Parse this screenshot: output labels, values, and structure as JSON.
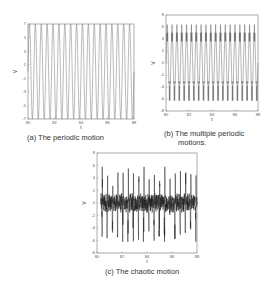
{
  "chart_data": [
    {
      "id": "a",
      "type": "line",
      "title": "(a)   The periodic motion",
      "xlabel": "t",
      "ylabel": "V",
      "xlim": [
        80,
        88
      ],
      "ylim": [
        -7,
        7
      ],
      "xticks": [
        "80",
        "82",
        "84",
        "86",
        "88"
      ],
      "yticks": [
        "7",
        "5",
        "3",
        "1",
        "-1",
        "-3",
        "-5",
        "-7"
      ],
      "series": [
        {
          "name": "V(t)",
          "form": "periodic",
          "cycles": 18,
          "amplitude": 7
        }
      ]
    },
    {
      "id": "b",
      "type": "line",
      "title": "(b) The multiple periodic motions.",
      "xlabel": "t",
      "ylabel": "V",
      "xlim": [
        80,
        88
      ],
      "ylim": [
        -8,
        8
      ],
      "xticks": [
        "80",
        "82",
        "84",
        "86",
        "88"
      ],
      "yticks": [
        "8",
        "6",
        "4",
        "2",
        "0",
        "-2",
        "-4",
        "-6",
        "-8"
      ],
      "series": [
        {
          "name": "V(t)",
          "form": "multi-periodic",
          "cycles": 19,
          "amplitude": 6.4,
          "band_inner": 2.6
        }
      ]
    },
    {
      "id": "c",
      "type": "line",
      "title": "(c) The chaotic motion",
      "xlabel": "t",
      "ylabel": "V",
      "xlim": [
        80,
        88
      ],
      "ylim": [
        -8,
        8
      ],
      "xticks": [
        "80",
        "82",
        "84",
        "86",
        "88"
      ],
      "yticks": [
        "8",
        "6",
        "4",
        "2",
        "0",
        "-2",
        "-4",
        "-6",
        "-8"
      ],
      "series": [
        {
          "name": "V(t)",
          "form": "chaotic",
          "range": [
            -6.2,
            5.8
          ]
        }
      ]
    }
  ],
  "captions": {
    "a": "(a)   The periodic motion",
    "b_line1": "(b) The multiple periodic",
    "b_line2": "motions.",
    "c": "(c) The chaotic motion"
  }
}
